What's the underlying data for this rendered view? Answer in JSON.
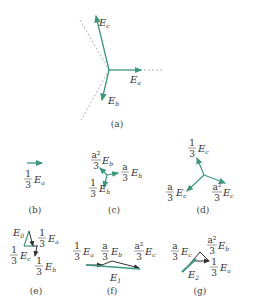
{
  "colors": {
    "vector": "#3a9a78",
    "dark": "#333333",
    "dashed": "#777777"
  },
  "panels": {
    "a": {
      "caption": "(a)",
      "labels": {
        "Ea": "E",
        "Ea_sub": "a",
        "Eb": "E",
        "Eb_sub": "b",
        "Ec": "E",
        "Ec_sub": "c"
      }
    },
    "b": {
      "caption": "(b)",
      "coef_num": "1",
      "coef_den": "3",
      "vec": "E",
      "vec_sub": "a"
    },
    "c": {
      "caption": "(c)",
      "t1": {
        "num": "a²",
        "den": "3",
        "vec": "E",
        "sub": "b"
      },
      "t2": {
        "num": "a",
        "den": "3",
        "vec": "E",
        "sub": "b"
      },
      "t3": {
        "num": "1",
        "den": "3",
        "vec": "E",
        "sub": "b"
      }
    },
    "d": {
      "caption": "(d)",
      "t1": {
        "num": "1",
        "den": "3",
        "vec": "E",
        "sub": "c"
      },
      "t2": {
        "num": "a",
        "den": "3",
        "vec": "E",
        "sub": "c"
      },
      "t3": {
        "num": "a²",
        "den": "3",
        "vec": "E",
        "sub": "c"
      }
    },
    "e": {
      "caption": "(e)",
      "result": "E",
      "result_sub": "0",
      "t1": {
        "num": "1",
        "den": "3",
        "vec": "E",
        "sub": "a"
      },
      "t2": {
        "num": "1",
        "den": "3",
        "vec": "E",
        "sub": "c"
      },
      "t3": {
        "num": "1",
        "den": "3",
        "vec": "E",
        "sub": "b"
      }
    },
    "f": {
      "caption": "(f)",
      "result": "E",
      "result_sub": "1",
      "t1": {
        "num": "1",
        "den": "3",
        "vec": "E",
        "sub": "a"
      },
      "t2": {
        "num": "a",
        "den": "3",
        "vec": "E",
        "sub": "b"
      },
      "t3": {
        "num": "a²",
        "den": "3",
        "vec": "E",
        "sub": "c"
      }
    },
    "g": {
      "caption": "(g)",
      "result": "E",
      "result_sub": "2",
      "t1": {
        "num": "a",
        "den": "3",
        "vec": "E",
        "sub": "c"
      },
      "t2": {
        "num": "a²",
        "den": "3",
        "vec": "E",
        "sub": "b"
      },
      "t3": {
        "num": "1",
        "den": "3",
        "vec": "E",
        "sub": "a"
      }
    }
  }
}
